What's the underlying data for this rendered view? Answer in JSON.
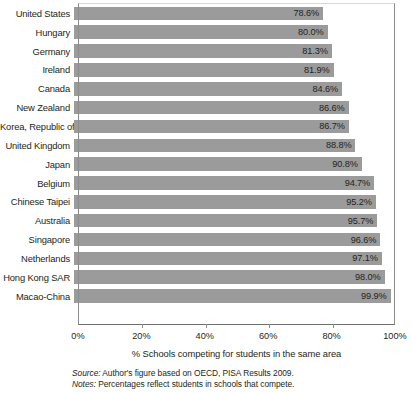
{
  "chart_data": {
    "type": "bar",
    "orientation": "horizontal",
    "title": "",
    "xlabel": "% Schools competing for students in the same area",
    "ylabel": "",
    "xlim": [
      0,
      100
    ],
    "xticks": [
      "0%",
      "20%",
      "40%",
      "60%",
      "80%",
      "100%"
    ],
    "xtick_values": [
      0,
      20,
      40,
      60,
      80,
      100
    ],
    "grid": false,
    "legend": false,
    "bar_color": "#9b9b9b",
    "categories": [
      "United States",
      "Hungary",
      "Germany",
      "Ireland",
      "Canada",
      "New Zealand",
      "Korea, Republic of",
      "United Kingdom",
      "Japan",
      "Belgium",
      "Chinese Taipei",
      "Australia",
      "Singapore",
      "Netherlands",
      "Hong Kong SAR",
      "Macao-China"
    ],
    "values": [
      78.6,
      80.0,
      81.3,
      81.9,
      84.6,
      86.6,
      86.7,
      88.8,
      90.8,
      94.7,
      95.2,
      95.7,
      96.6,
      97.1,
      98.0,
      99.9
    ],
    "value_labels": [
      "78.6%",
      "80.0%",
      "81.3%",
      "81.9%",
      "84.6%",
      "86.6%",
      "86.7%",
      "88.8%",
      "90.8%",
      "94.7%",
      "95.2%",
      "95.7%",
      "96.6%",
      "97.1%",
      "98.0%",
      "99.9%"
    ]
  },
  "footnotes": {
    "source_prefix": "Source:",
    "source_text": " Author's figure based on OECD, PISA Results 2009.",
    "notes_prefix": "Notes:",
    "notes_text": " Percentages reflect students in schools that compete."
  }
}
